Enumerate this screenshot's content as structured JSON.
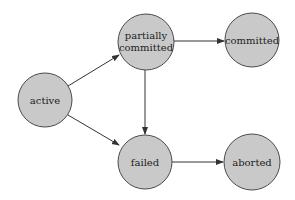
{
  "diagram": {
    "type": "state-transition",
    "nodes": [
      {
        "id": "active",
        "label_lines": [
          "active"
        ]
      },
      {
        "id": "partially-committed",
        "label_lines": [
          "partially",
          "committed"
        ]
      },
      {
        "id": "committed",
        "label_lines": [
          "committed"
        ]
      },
      {
        "id": "failed",
        "label_lines": [
          "failed"
        ]
      },
      {
        "id": "aborted",
        "label_lines": [
          "aborted"
        ]
      }
    ],
    "edges": [
      {
        "from": "active",
        "to": "partially-committed"
      },
      {
        "from": "active",
        "to": "failed"
      },
      {
        "from": "partially-committed",
        "to": "committed"
      },
      {
        "from": "partially-committed",
        "to": "failed"
      },
      {
        "from": "failed",
        "to": "aborted"
      }
    ],
    "colors": {
      "node_fill": "#c9c9c9",
      "node_stroke": "#4a4a4a",
      "edge": "#333333"
    }
  }
}
